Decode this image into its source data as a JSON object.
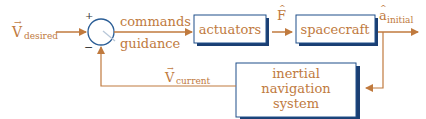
{
  "diagram": {
    "type": "block-diagram",
    "colors": {
      "accent": "#c07a3e",
      "box_border": "#1f4f8a",
      "box_shadow": "#1b3f73",
      "junction": "#2a5d96"
    },
    "input": {
      "symbol": "V",
      "subscript": "desired"
    },
    "junction": {
      "plus": "+",
      "minus": "−"
    },
    "labels": {
      "commands": "commands",
      "guidance": "guidance"
    },
    "blocks": {
      "actuators": "actuators",
      "spacecraft": "spacecraft",
      "ins_line1": "inertial",
      "ins_line2": "navigation",
      "ins_line3": "system"
    },
    "signals": {
      "force": {
        "symbol": "F"
      },
      "accel": {
        "symbol": "a",
        "subscript": "initial"
      },
      "feedback": {
        "symbol": "V",
        "subscript": "current"
      }
    }
  }
}
